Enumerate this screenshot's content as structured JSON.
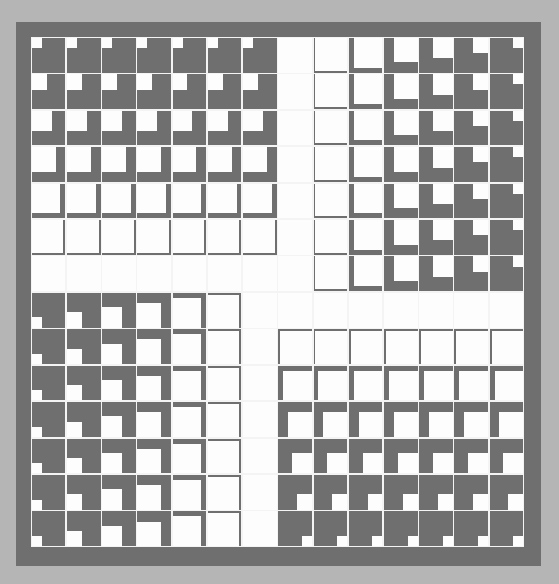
{
  "artwork": {
    "type": "geometric-tile-grid",
    "grid": {
      "rows": 14,
      "cols": 14
    },
    "colors": {
      "background": "#b5b5b5",
      "frame": "#6f6f6f",
      "tile_gray": "#6f6f6f",
      "tile_white": "#fdfdfd",
      "gutter": "#f4f4f4"
    },
    "thickness_steps": [
      24,
      19,
      14,
      10,
      5,
      2,
      0
    ],
    "quadrants": [
      {
        "name": "top-left",
        "rows": [
          0,
          6
        ],
        "cols": [
          0,
          6
        ],
        "gray_sides": [
          "bottom",
          "right"
        ],
        "hole_corner": "top-left",
        "vary_by": "row",
        "order": "descending"
      },
      {
        "name": "top-right",
        "rows": [
          0,
          6
        ],
        "cols": [
          7,
          13
        ],
        "gray_sides": [
          "left",
          "bottom"
        ],
        "hole_corner": "top-right",
        "vary_by": "col",
        "order": "ascending"
      },
      {
        "name": "bottom-left",
        "rows": [
          7,
          13
        ],
        "cols": [
          0,
          6
        ],
        "gray_sides": [
          "top",
          "right"
        ],
        "hole_corner": "bottom-left",
        "vary_by": "col",
        "order": "descending"
      },
      {
        "name": "bottom-right",
        "rows": [
          7,
          13
        ],
        "cols": [
          7,
          13
        ],
        "gray_sides": [
          "top",
          "left"
        ],
        "hole_corner": "bottom-right",
        "vary_by": "row",
        "order": "ascending"
      }
    ]
  }
}
